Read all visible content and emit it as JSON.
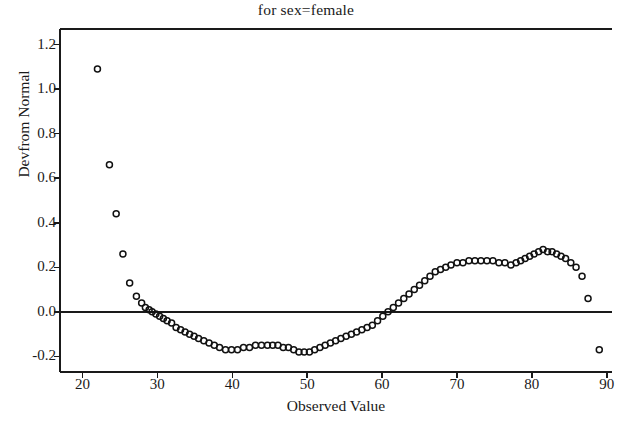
{
  "chart_data": {
    "type": "scatter",
    "title": "for sex=female",
    "xlabel": "Observed Value",
    "ylabel": "Devfrom Normal",
    "xlim": [
      17.0,
      91.5
    ],
    "ylim": [
      -0.27,
      1.27
    ],
    "xticks": [
      20,
      30,
      40,
      50,
      60,
      70,
      80,
      90
    ],
    "xtick_labels": [
      "20",
      "30",
      "40",
      "50",
      "60",
      "70",
      "80",
      "90"
    ],
    "yticks": [
      -0.2,
      0.0,
      0.2,
      0.4,
      0.6,
      0.8,
      1.0,
      1.2
    ],
    "ytick_labels": [
      "-0.2",
      "0.0",
      "0.2",
      "0.4",
      "0.6",
      "0.8",
      "1.0",
      "1.2"
    ],
    "grid": false,
    "legend": null,
    "reference_lines": [
      {
        "axis": "y",
        "value": 0.0
      }
    ],
    "marker": {
      "style": "open-circle",
      "size": 6,
      "color": "#111111"
    },
    "x": [
      22.0,
      23.6,
      24.5,
      25.4,
      26.3,
      27.2,
      27.9,
      28.4,
      28.9,
      29.3,
      29.8,
      30.3,
      30.8,
      31.3,
      31.9,
      32.5,
      33.1,
      33.7,
      34.3,
      34.9,
      35.5,
      36.2,
      36.9,
      37.6,
      38.3,
      39.1,
      39.9,
      40.7,
      41.5,
      42.3,
      43.1,
      43.9,
      44.7,
      45.4,
      46.1,
      46.8,
      47.5,
      48.2,
      48.9,
      49.6,
      50.3,
      51.0,
      51.7,
      52.4,
      53.1,
      53.8,
      54.5,
      55.2,
      55.9,
      56.6,
      57.3,
      58.0,
      58.7,
      59.4,
      60.1,
      60.8,
      61.5,
      62.2,
      62.9,
      63.6,
      64.3,
      65.0,
      65.7,
      66.4,
      67.1,
      67.8,
      68.5,
      69.2,
      70.0,
      70.8,
      71.6,
      72.4,
      73.2,
      74.0,
      74.8,
      75.6,
      76.4,
      77.2,
      77.9,
      78.5,
      79.1,
      79.7,
      80.3,
      80.9,
      81.5,
      82.1,
      82.7,
      83.3,
      83.9,
      84.5,
      85.2,
      85.9,
      86.7,
      87.5,
      89.0
    ],
    "y": [
      1.09,
      0.66,
      0.44,
      0.26,
      0.13,
      0.07,
      0.04,
      0.02,
      0.01,
      0.0,
      -0.01,
      -0.02,
      -0.03,
      -0.04,
      -0.05,
      -0.07,
      -0.08,
      -0.09,
      -0.1,
      -0.11,
      -0.12,
      -0.13,
      -0.14,
      -0.15,
      -0.16,
      -0.17,
      -0.17,
      -0.17,
      -0.16,
      -0.16,
      -0.15,
      -0.15,
      -0.15,
      -0.15,
      -0.15,
      -0.16,
      -0.16,
      -0.17,
      -0.18,
      -0.18,
      -0.18,
      -0.17,
      -0.16,
      -0.15,
      -0.14,
      -0.13,
      -0.12,
      -0.11,
      -0.1,
      -0.09,
      -0.08,
      -0.07,
      -0.06,
      -0.04,
      -0.02,
      0.0,
      0.02,
      0.04,
      0.06,
      0.08,
      0.1,
      0.12,
      0.14,
      0.16,
      0.18,
      0.19,
      0.2,
      0.21,
      0.22,
      0.22,
      0.23,
      0.23,
      0.23,
      0.23,
      0.23,
      0.22,
      0.22,
      0.21,
      0.22,
      0.23,
      0.24,
      0.25,
      0.26,
      0.27,
      0.28,
      0.27,
      0.27,
      0.26,
      0.25,
      0.24,
      0.22,
      0.2,
      0.16,
      0.06,
      -0.17
    ]
  },
  "axes": {
    "frame_color": "#1a1a1a",
    "tick_color": "#1a1a1a"
  }
}
